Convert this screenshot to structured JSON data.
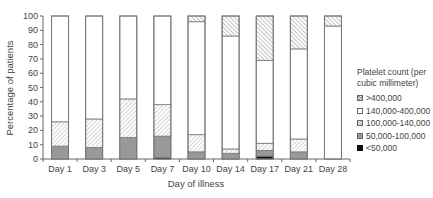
{
  "chart_data": {
    "type": "bar",
    "stacked": true,
    "title": "",
    "xlabel": "Day of illness",
    "ylabel": "Percentage of patients",
    "ylim": [
      0,
      100
    ],
    "yticks": [
      0,
      10,
      20,
      30,
      40,
      50,
      60,
      70,
      80,
      90,
      100
    ],
    "categories": [
      "Day 1",
      "Day 3",
      "Day 5",
      "Day 7",
      "Day 10",
      "Day 14",
      "Day 17",
      "Day 21",
      "Day 28"
    ],
    "legend_title": "Platelet count (per cubic millimeter)",
    "series": [
      {
        "name": "<50,000",
        "fill": "#111111",
        "pattern": "solid",
        "values": [
          0,
          0,
          0,
          1,
          0,
          0,
          2,
          0,
          0
        ]
      },
      {
        "name": "50,000-100,000",
        "fill": "#999999",
        "pattern": "solid",
        "values": [
          9,
          8,
          15,
          15,
          5,
          4,
          4,
          5,
          0
        ]
      },
      {
        "name": "100,000-140,000",
        "fill": "#ffffff",
        "pattern": "light-hatch",
        "values": [
          17,
          20,
          27,
          22,
          12,
          3,
          5,
          9,
          0
        ]
      },
      {
        "name": "140,000-400,000",
        "fill": "#ffffff",
        "pattern": "none",
        "values": [
          74,
          72,
          58,
          62,
          79,
          79,
          58,
          63,
          93
        ]
      },
      {
        "name": ">400,000",
        "fill": "#ffffff",
        "pattern": "dense-hatch",
        "values": [
          0,
          0,
          0,
          0,
          4,
          14,
          31,
          23,
          7
        ]
      }
    ],
    "grid": false,
    "legend_position": "right"
  },
  "legend": {
    "title_line1": "Platelet count (per",
    "title_line2": "cubic millimeter)",
    "items": [
      ">400,000",
      "140,000-400,000",
      "100,000-140,000",
      "50,000-100,000",
      "<50,000"
    ]
  },
  "axes": {
    "xlabel": "Day of illness",
    "ylabel": "Percentage of patients"
  }
}
